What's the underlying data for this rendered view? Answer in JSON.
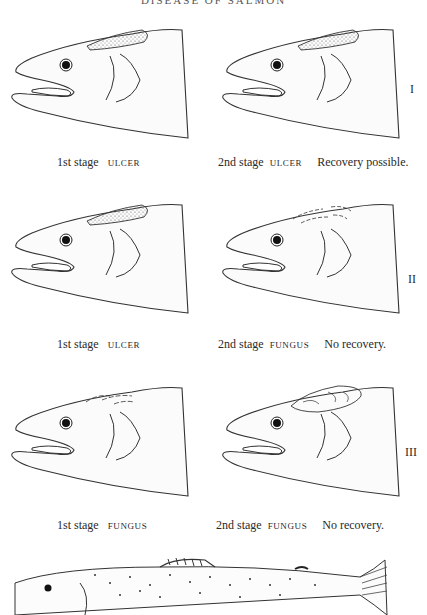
{
  "header": {
    "title": "DISEASE OF SALMON"
  },
  "rows": [
    {
      "roman": "I",
      "left": {
        "stage": "1st stage",
        "type": "ULCER",
        "note": ""
      },
      "right": {
        "stage": "2nd stage",
        "type": "ULCER",
        "note": "Recovery possible."
      }
    },
    {
      "roman": "II",
      "left": {
        "stage": "1st stage",
        "type": "ULCER",
        "note": ""
      },
      "right": {
        "stage": "2nd stage",
        "type": "FUNGUS",
        "note": "No recovery."
      }
    },
    {
      "roman": "III",
      "left": {
        "stage": "1st stage",
        "type": "FUNGUS",
        "note": ""
      },
      "right": {
        "stage": "2nd stage",
        "type": "FUNGUS",
        "note": "No recovery."
      }
    }
  ],
  "figure": {
    "bottom": "whole-fish-illustration"
  }
}
